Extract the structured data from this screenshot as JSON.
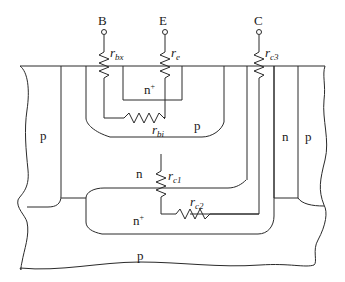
{
  "diagram": {
    "type": "bipolar-transistor-cross-section",
    "terminals": [
      {
        "id": "base",
        "label": "B"
      },
      {
        "id": "emitter",
        "label": "E"
      },
      {
        "id": "collector",
        "label": "C"
      }
    ],
    "resistors": [
      {
        "id": "rbx",
        "main": "r",
        "sub": "bx"
      },
      {
        "id": "re",
        "main": "r",
        "sub": "e"
      },
      {
        "id": "rc3",
        "main": "r",
        "sub": "c3"
      },
      {
        "id": "rbi",
        "main": "r",
        "sub": "bi"
      },
      {
        "id": "rc1",
        "main": "r",
        "sub": "c1"
      },
      {
        "id": "rc2",
        "main": "r",
        "sub": "c2"
      }
    ],
    "regions": {
      "emitter": "n",
      "emitter_sup": "+",
      "base": "p",
      "left_isolation": "p",
      "collector_epi": "n",
      "buried_layer": "n",
      "buried_layer_sup": "+",
      "collector_sinker": "n",
      "right_isolation": "p",
      "substrate": "p"
    }
  }
}
